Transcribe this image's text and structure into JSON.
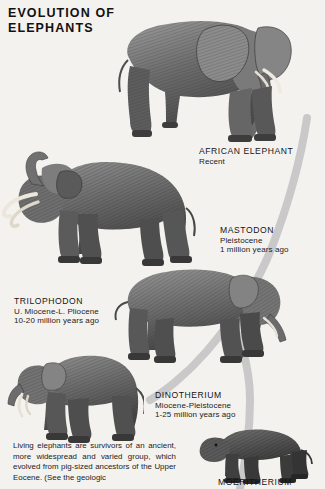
{
  "page": {
    "title": "EVOLUTION OF\nELEPHANTS",
    "background_color": "#f4f2ef",
    "swoosh_color": "#c9c9c9",
    "ink_color": "#141414"
  },
  "figures": [
    {
      "id": "african-elephant",
      "name": "African Elephant",
      "caption": {
        "name": "AFRICAN ELEPHANT",
        "line1": "Recent",
        "line2": ""
      }
    },
    {
      "id": "mastodon",
      "name": "Mastodon",
      "caption": {
        "name": "MASTODON",
        "line1": "Pleistocene",
        "line2": "1 million years ago"
      }
    },
    {
      "id": "trilophodon",
      "name": "Trilophodon",
      "caption": {
        "name": "TRILOPHODON",
        "line1": "U. Miocene-L. Pliocene",
        "line2": "10-20 million years ago"
      }
    },
    {
      "id": "dinotherium",
      "name": "Dinotherium",
      "caption": {
        "name": "DINOTHERIUM",
        "line1": "Miocene-Pleistocene",
        "line2": "1-25 million years ago"
      }
    },
    {
      "id": "moeritherium",
      "name": "Moeritherium",
      "caption": {
        "name": "MOERITHERIUM",
        "line1": "",
        "line2": ""
      }
    }
  ],
  "body": {
    "text": "Living elephants are survivors of an ancient, more widespread and varied group, which evolved from pig-sized ancestors of the Upper Eocene. (See the geologic"
  }
}
